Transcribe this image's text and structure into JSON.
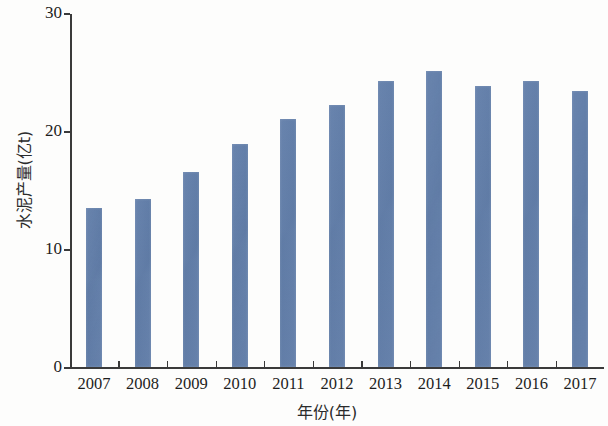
{
  "chart_data": {
    "type": "bar",
    "title": "",
    "xlabel": "年份(年)",
    "ylabel": "水泥产量(亿t)",
    "categories": [
      "2007",
      "2008",
      "2009",
      "2010",
      "2011",
      "2012",
      "2013",
      "2014",
      "2015",
      "2016",
      "2017"
    ],
    "values": [
      13.5,
      14.2,
      16.5,
      18.9,
      21.0,
      22.2,
      24.2,
      25.1,
      23.8,
      24.2,
      23.4
    ],
    "series": [
      {
        "name": "水泥产量",
        "values": [
          13.5,
          14.2,
          16.5,
          18.9,
          21.0,
          22.2,
          24.2,
          25.1,
          23.8,
          24.2,
          23.4
        ]
      }
    ],
    "ylim": [
      0,
      30
    ],
    "yticks": [
      0,
      10,
      20,
      30
    ],
    "ytick_labels": [
      "0",
      "10",
      "20",
      "30"
    ],
    "grid": false,
    "legend": false,
    "legend_position": "none",
    "bar_color": "#5d7cab",
    "axis_color": "#3a3a3a",
    "background_color": "#fdfdfc"
  }
}
